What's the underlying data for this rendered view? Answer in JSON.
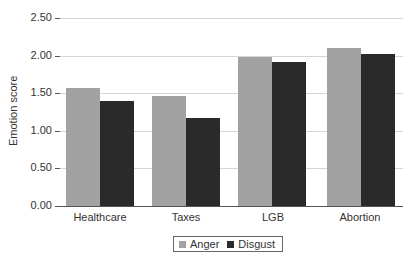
{
  "chart_data": {
    "type": "bar",
    "title": "",
    "xlabel": "",
    "ylabel": "Emotion score",
    "ylim": [
      0,
      2.5
    ],
    "yticks": [
      "0.00",
      "0.50",
      "1.00",
      "1.50",
      "2.00",
      "2.50"
    ],
    "grid": true,
    "legend_position": "bottom",
    "categories": [
      "Healthcare",
      "Taxes",
      "LGB",
      "Abortion"
    ],
    "series": [
      {
        "name": "Anger",
        "color": "#a2a2a2",
        "values": [
          1.57,
          1.46,
          1.98,
          2.1
        ]
      },
      {
        "name": "Disgust",
        "color": "#2a2a2a",
        "values": [
          1.4,
          1.17,
          1.91,
          2.02
        ]
      }
    ]
  },
  "axis": {
    "y_title": "Emotion score",
    "ticks": [
      "0.00",
      "0.50",
      "1.00",
      "1.50",
      "2.00",
      "2.50"
    ]
  },
  "categories": [
    "Healthcare",
    "Taxes",
    "LGB",
    "Abortion"
  ],
  "legend": {
    "items": [
      {
        "label": "Anger",
        "color": "#a2a2a2"
      },
      {
        "label": "Disgust",
        "color": "#2a2a2a"
      }
    ]
  }
}
